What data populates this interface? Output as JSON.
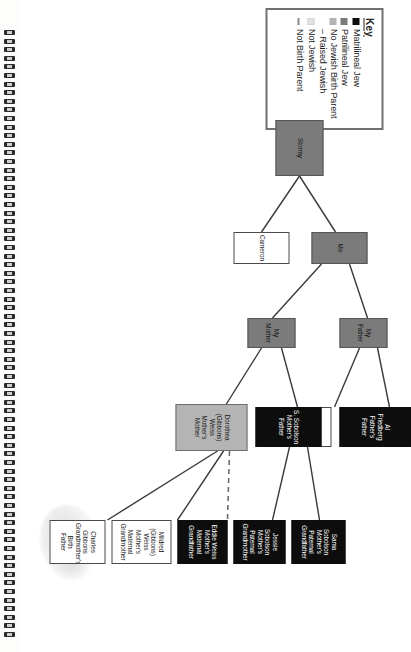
{
  "document": {
    "type": "family-tree-diagram",
    "orientation": "rotated-90-clockwise",
    "binding": "spiral-coil-left-edge"
  },
  "legend": {
    "title": "Key",
    "items": [
      {
        "label": "Matrilineal Jew",
        "swatch": "black-square",
        "color": "#0d0d0d",
        "style": "fill"
      },
      {
        "label": "Patrilineal Jew",
        "swatch": "dark-gray-square",
        "color": "#7b7b7b",
        "style": "fill"
      },
      {
        "label": "No Jewish Birth Parent – Raised Jewish",
        "swatch": "medium-gray-square",
        "color": "#b4b4b4",
        "style": "fill"
      },
      {
        "label": "Not Jewish",
        "swatch": "light-gray-square",
        "color": "#e2e2e2",
        "style": "fill"
      },
      {
        "label": "Not Birth Parent",
        "swatch": "dashed-line",
        "color": "#8a8a8a",
        "style": "dash"
      }
    ]
  },
  "tree": {
    "nodes": [
      {
        "id": "stormy",
        "line1": "Stormy",
        "line2": "",
        "line3": "",
        "category": "patrilineal",
        "generation": "child"
      },
      {
        "id": "me",
        "line1": "Me",
        "line2": "",
        "line3": "",
        "category": "patrilineal",
        "generation": "self"
      },
      {
        "id": "cameron",
        "line1": "Cameron",
        "line2": "",
        "line3": "",
        "category": "notjewish",
        "generation": "self"
      },
      {
        "id": "father",
        "line1": "My Father",
        "line2": "",
        "line3": "",
        "category": "patrilineal",
        "generation": "parent"
      },
      {
        "id": "mother",
        "line1": "My Mother",
        "line2": "",
        "line3": "",
        "category": "patrilineal",
        "generation": "parent"
      },
      {
        "id": "alfried",
        "line1": "Al Friedberg",
        "line2": "Father's Father",
        "line3": "",
        "category": "matrilineal",
        "generation": "grandparent"
      },
      {
        "id": "tinafried",
        "line1": "Tina Friedberg",
        "line2": "Father's Mother",
        "line3": "",
        "category": "notjewish",
        "generation": "grandparent"
      },
      {
        "id": "ssobolson",
        "line1": "S. Sobolson",
        "line2": "Mother's Father",
        "line3": "",
        "category": "matrilineal",
        "generation": "grandparent"
      },
      {
        "id": "dorothea",
        "line1": "Dorothea",
        "line2": "(Gibbons) Weiss",
        "line3": "Mother's Mother",
        "category": "nojewishbirth",
        "generation": "grandparent"
      },
      {
        "id": "samasob",
        "line1": "Sama Sobolson",
        "line2": "Mother's Paternal",
        "line3": "Grandfather",
        "category": "matrilineal",
        "generation": "great-grandparent"
      },
      {
        "id": "jessiesob",
        "line1": "Jessie Sobolson",
        "line2": "Mother's Paternal",
        "line3": "Grandmother",
        "category": "matrilineal",
        "generation": "great-grandparent"
      },
      {
        "id": "eddieweiss",
        "line1": "Eddie Weiss",
        "line2": "Mother's Maternal",
        "line3": "Grandfather",
        "category": "matrilineal",
        "generation": "great-grandparent"
      },
      {
        "id": "mildred",
        "line1": "Mildred (Gibbons)",
        "line2": "Weiss",
        "line3": "Mother's Maternal Grandmother",
        "category": "notjewish",
        "generation": "great-grandparent"
      },
      {
        "id": "charles",
        "line1": "Charles Gibbons",
        "line2": "Grandmother's Birth",
        "line3": "Father",
        "category": "notjewish",
        "generation": "great-grandparent"
      }
    ],
    "edges": [
      {
        "from": "stormy",
        "to": "me",
        "style": "solid"
      },
      {
        "from": "stormy",
        "to": "cameron",
        "style": "solid"
      },
      {
        "from": "me",
        "to": "father",
        "style": "solid"
      },
      {
        "from": "me",
        "to": "mother",
        "style": "solid"
      },
      {
        "from": "father",
        "to": "alfried",
        "style": "solid"
      },
      {
        "from": "father",
        "to": "tinafried",
        "style": "solid"
      },
      {
        "from": "mother",
        "to": "ssobolson",
        "style": "solid"
      },
      {
        "from": "mother",
        "to": "dorothea",
        "style": "solid"
      },
      {
        "from": "ssobolson",
        "to": "samasob",
        "style": "solid"
      },
      {
        "from": "ssobolson",
        "to": "jessiesob",
        "style": "solid"
      },
      {
        "from": "dorothea",
        "to": "eddieweiss",
        "style": "dashed"
      },
      {
        "from": "dorothea",
        "to": "mildred",
        "style": "solid"
      },
      {
        "from": "dorothea",
        "to": "charles",
        "style": "solid"
      }
    ]
  }
}
